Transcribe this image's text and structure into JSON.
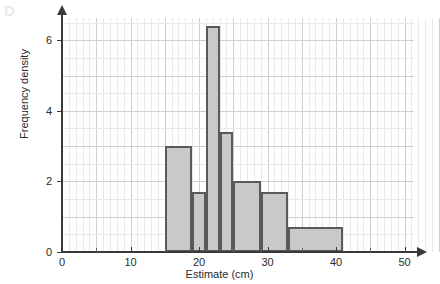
{
  "watermark": {
    "label": "D"
  },
  "chart_data": {
    "type": "bar",
    "title": "",
    "subtitle": "",
    "xlabel": "Estimate (cm)",
    "ylabel": "Frequency density",
    "xlim": [
      0,
      55
    ],
    "ylim": [
      0,
      7
    ],
    "grid": true,
    "legend": null,
    "x_ticks": [
      {
        "value": 0,
        "label": "0"
      },
      {
        "value": 10,
        "label": "10"
      },
      {
        "value": 20,
        "label": "20"
      },
      {
        "value": 30,
        "label": "30"
      },
      {
        "value": 40,
        "label": "40"
      },
      {
        "value": 50,
        "label": "50"
      }
    ],
    "x_minor_ticks": [
      5,
      15,
      25,
      35,
      45
    ],
    "y_ticks": [
      {
        "value": 0,
        "label": "0"
      },
      {
        "value": 2,
        "label": "2"
      },
      {
        "value": 4,
        "label": "4"
      },
      {
        "value": 6,
        "label": "6"
      }
    ],
    "bars": [
      {
        "x_start": 15,
        "x_end": 19,
        "height": 3.0
      },
      {
        "x_start": 19,
        "x_end": 21,
        "height": 1.7
      },
      {
        "x_start": 21,
        "x_end": 23,
        "height": 6.4
      },
      {
        "x_start": 23,
        "x_end": 25,
        "height": 3.4
      },
      {
        "x_start": 25,
        "x_end": 29,
        "height": 2.0
      },
      {
        "x_start": 29,
        "x_end": 33,
        "height": 1.7
      },
      {
        "x_start": 33,
        "x_end": 41,
        "height": 0.7
      }
    ],
    "colors": {
      "bar_fill": "#c9c9c9",
      "bar_stroke": "#5a5a5a",
      "axis": "#3a3a3a",
      "grid_minor": "#e9e9e9",
      "grid_major": "#cfcfcf"
    }
  }
}
